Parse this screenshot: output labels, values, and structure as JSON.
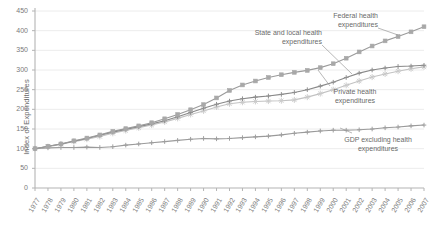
{
  "chart_data": {
    "type": "line",
    "title": "",
    "xlabel": "",
    "ylabel": "Index of Expenditures",
    "ylim": [
      0,
      450
    ],
    "ytick_step": 50,
    "yticks": [
      0,
      50,
      100,
      150,
      200,
      250,
      300,
      350,
      400,
      450
    ],
    "grid": true,
    "grid_axis": "y",
    "legend_position": "inline-annotations",
    "base_year": 1977,
    "base_index": 100,
    "x": [
      1977,
      1978,
      1979,
      1980,
      1981,
      1982,
      1983,
      1984,
      1985,
      1986,
      1987,
      1988,
      1989,
      1990,
      1991,
      1992,
      1993,
      1994,
      1995,
      1996,
      1997,
      1998,
      1999,
      2000,
      2001,
      2002,
      2003,
      2004,
      2005,
      2006,
      2007
    ],
    "categories": [
      "1977",
      "1978",
      "1979",
      "1980",
      "1981",
      "1982",
      "1983",
      "1984",
      "1985",
      "1986",
      "1987",
      "1988",
      "1989",
      "1990",
      "1991",
      "1992",
      "1993",
      "1994",
      "1995",
      "1996",
      "1997",
      "1998",
      "1999",
      "2000",
      "2001",
      "2002",
      "2003",
      "2004",
      "2005",
      "2006",
      "2007"
    ],
    "series": [
      {
        "name": "Federal health expenditures",
        "marker": "square",
        "color": "#a8a8a8",
        "line_color": "#9a9a9a",
        "values": [
          100,
          106,
          112,
          120,
          127,
          135,
          144,
          151,
          158,
          166,
          176,
          187,
          199,
          212,
          229,
          248,
          262,
          272,
          281,
          288,
          294,
          299,
          306,
          316,
          330,
          346,
          361,
          374,
          385,
          397,
          410
        ]
      },
      {
        "name": "State and local health expenditures",
        "marker": "star",
        "color": "#c9c9c9",
        "line_color": "#c2c2c2",
        "values": [
          100,
          105,
          111,
          118,
          124,
          131,
          139,
          146,
          153,
          160,
          168,
          177,
          187,
          196,
          206,
          214,
          218,
          220,
          221,
          222,
          224,
          231,
          240,
          250,
          261,
          272,
          282,
          290,
          297,
          303,
          308
        ]
      },
      {
        "name": "Private health expenditures",
        "marker": "plus",
        "color": "#8f8f8f",
        "line_color": "#888888",
        "values": [
          100,
          106,
          112,
          119,
          126,
          134,
          142,
          149,
          156,
          163,
          171,
          181,
          192,
          203,
          213,
          221,
          227,
          231,
          234,
          238,
          243,
          250,
          259,
          269,
          281,
          292,
          300,
          305,
          309,
          310,
          312
        ]
      },
      {
        "name": "GDP excluding health expenditures",
        "marker": "plus",
        "color": "#9e9e9e",
        "line_color": "#9a9a9a",
        "values": [
          100,
          102,
          103,
          103,
          104,
          103,
          105,
          109,
          112,
          115,
          118,
          121,
          124,
          126,
          125,
          126,
          128,
          130,
          132,
          135,
          139,
          142,
          145,
          147,
          147,
          148,
          150,
          153,
          155,
          158,
          160
        ]
      }
    ],
    "annotations": [
      {
        "id": "federal",
        "text_lines": [
          "Federal health",
          "expenditures"
        ],
        "target_year": 2006,
        "align": "right"
      },
      {
        "id": "state-local",
        "text_lines": [
          "State and local health",
          "expenditures"
        ],
        "target_year": 2000,
        "align": "right"
      },
      {
        "id": "private",
        "text_lines": [
          "Private health",
          "expenditures"
        ],
        "target_year": 2001,
        "align": "center"
      },
      {
        "id": "gdp",
        "text_lines": [
          "GDP excluding health",
          "expenditures"
        ],
        "target_year": 2002,
        "align": "center"
      }
    ]
  },
  "axes": {
    "y_axis_label": "Index of Expenditures",
    "y_tick_labels": [
      "450",
      "400",
      "350",
      "300",
      "250",
      "200",
      "150",
      "100",
      "50",
      "0"
    ],
    "x_tick_labels": [
      "1977",
      "1978",
      "1979",
      "1980",
      "1981",
      "1982",
      "1983",
      "1984",
      "1985",
      "1986",
      "1987",
      "1988",
      "1989",
      "1990",
      "1991",
      "1992",
      "1993",
      "1994",
      "1995",
      "1996",
      "1997",
      "1998",
      "1999",
      "2000",
      "2001",
      "2002",
      "2003",
      "2004",
      "2005",
      "2006",
      "2007"
    ]
  },
  "annotation_text": {
    "federal_l1": "Federal health",
    "federal_l2": "expenditures",
    "state_l1": "State and local health",
    "state_l2": "expenditures",
    "private_l1": "Private health",
    "private_l2": "expenditures",
    "gdp_l1": "GDP excluding health",
    "gdp_l2": "expenditures"
  },
  "colors": {
    "axis": "#b4b4b4",
    "grid": "#ececec",
    "text": "#6e6e6e",
    "federal": "#a8a8a8",
    "state_local": "#c9c9c9",
    "private": "#8f8f8f",
    "gdp": "#9e9e9e",
    "background": "#ffffff"
  }
}
